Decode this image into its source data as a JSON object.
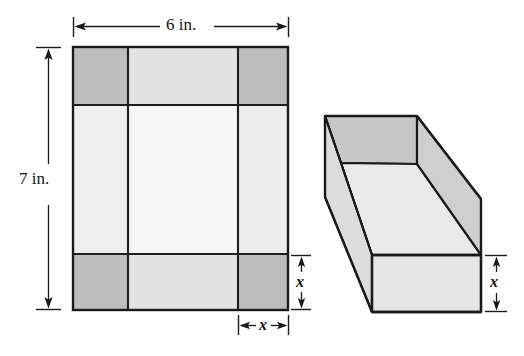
{
  "figure": {
    "type": "geometry-diagram",
    "background_color": "#ffffff",
    "stroke_color": "#1a1a1a"
  },
  "labels": {
    "width_label": "6 in.",
    "height_label": "7 in.",
    "cut_width_label": "x",
    "cut_depth_label_sheet": "x",
    "box_height_label": "x"
  },
  "sheet": {
    "name": "flat-sheet",
    "outer": {
      "x": 73,
      "y": 47,
      "width": 215,
      "height": 263
    },
    "grid": {
      "vertical_lines": [
        128,
        238
      ],
      "horizontal_lines": [
        105,
        254
      ]
    },
    "fills": {
      "corner_square": "#bdbdbd",
      "top_strip": "#e2e2e2",
      "bottom_strip": "#e2e2e2",
      "side_strip": "#eeeeee",
      "center_panel": "#f6f6f6"
    },
    "corner_squares": [
      {
        "name": "corner-top-left",
        "x": 73,
        "y": 47,
        "width": 55,
        "height": 58
      },
      {
        "name": "corner-top-right",
        "x": 238,
        "y": 47,
        "width": 50,
        "height": 58
      },
      {
        "name": "corner-bottom-left",
        "x": 73,
        "y": 254,
        "width": 55,
        "height": 56
      },
      {
        "name": "corner-bottom-right",
        "x": 238,
        "y": 254,
        "width": 50,
        "height": 56
      }
    ]
  },
  "dimensions": {
    "top": {
      "name": "dimension-6in",
      "y": 26,
      "x1": 73,
      "x2": 288,
      "text": "6 in."
    },
    "left": {
      "name": "dimension-7in",
      "x": 48,
      "y1": 47,
      "y2": 310,
      "text": "7 in."
    },
    "bottom_x": {
      "name": "dimension-x-width",
      "y": 325,
      "x1": 238,
      "x2": 288,
      "text": "x"
    },
    "right_x_sheet": {
      "name": "dimension-x-depth",
      "x": 288,
      "y1": 255,
      "y2": 310,
      "text": "x"
    },
    "right_x_box": {
      "name": "dimension-x-box-height",
      "x": 495,
      "y1": 255,
      "y2": 312,
      "text": "x"
    }
  },
  "box": {
    "name": "open-box",
    "fills": {
      "inner_back_wall": "#c9c9c9",
      "inner_floor": "#e9e9e9",
      "left_outer_wall": "#dedede",
      "front_outer_wall": "#e6e6e6",
      "right_outer_wall": "#d4d4d4",
      "rim": "#cfcfcf"
    },
    "vertices": {
      "back_top_left": [
        325,
        116
      ],
      "back_top_right": [
        417,
        116
      ],
      "back_inner_left": [
        341,
        163
      ],
      "back_inner_right": [
        417,
        164
      ],
      "front_top_left": [
        372,
        255
      ],
      "front_top_right": [
        481,
        255
      ],
      "front_bottom_left": [
        372,
        312
      ],
      "front_bottom_right": [
        481,
        312
      ],
      "left_rim_bottom": [
        325,
        197
      ],
      "right_rim_bottom": [
        481,
        199
      ]
    }
  }
}
